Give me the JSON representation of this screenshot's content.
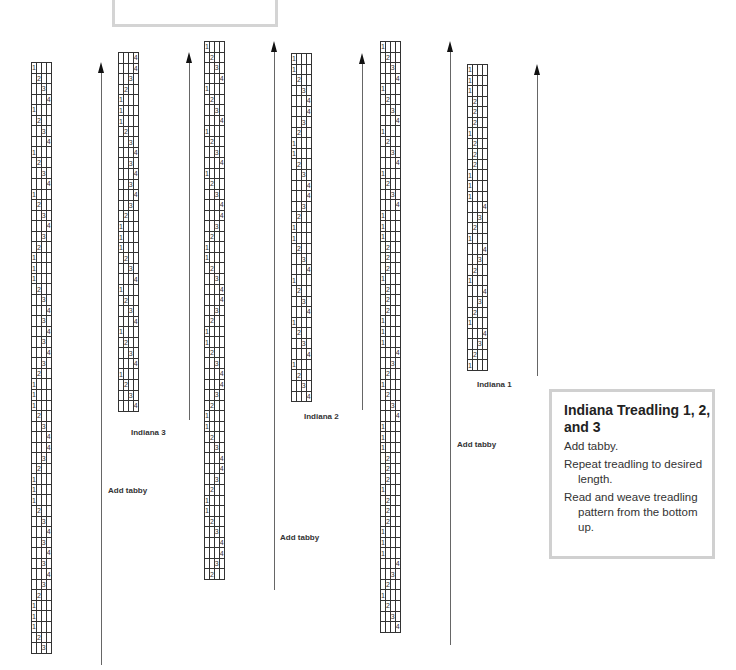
{
  "info": {
    "title": "Indiana Treadling 1, 2, and 3",
    "lines": [
      "Add tabby.",
      "Repeat treadling to desired length.",
      "Read and weave treadling pattern from the bottom up."
    ]
  },
  "drafts": [
    {
      "id": "draft-1",
      "caption": "",
      "tabby_label": "Add tabby",
      "left": 31,
      "top": 62,
      "arrow": {
        "x": 101,
        "top": 62,
        "bottom": 665
      },
      "tabby": {
        "x": 108,
        "y": 486
      },
      "rows": [
        1,
        2,
        3,
        4,
        1,
        2,
        3,
        4,
        1,
        2,
        3,
        4,
        1,
        2,
        3,
        4,
        3,
        2,
        1,
        1,
        1,
        2,
        3,
        4,
        3,
        4,
        3,
        4,
        3,
        2,
        1,
        1,
        1,
        2,
        3,
        4,
        4,
        3,
        2,
        1,
        1,
        1,
        2,
        3,
        4,
        3,
        4,
        3,
        4,
        3,
        2,
        1,
        1,
        1,
        2,
        3
      ]
    },
    {
      "id": "indiana-3",
      "caption": "Indiana 3",
      "tabby_label": "",
      "left": 118,
      "top": 52,
      "arrow": {
        "x": 189,
        "top": 52,
        "bottom": 420
      },
      "caption_pos": {
        "x": 131,
        "y": 428
      },
      "rows": [
        4,
        4,
        3,
        2,
        1,
        1,
        1,
        2,
        3,
        4,
        3,
        4,
        3,
        4,
        3,
        2,
        1,
        1,
        1,
        2,
        3,
        4,
        1,
        2,
        3,
        4,
        1,
        2,
        3,
        4,
        1,
        2,
        3,
        4
      ]
    },
    {
      "id": "draft-3",
      "caption": "",
      "tabby_label": "Add tabby",
      "left": 204,
      "top": 41,
      "arrow": {
        "x": 274,
        "top": 41,
        "bottom": 590
      },
      "tabby": {
        "x": 280,
        "y": 533
      },
      "rows": [
        1,
        2,
        3,
        4,
        1,
        2,
        3,
        4,
        1,
        2,
        3,
        4,
        1,
        2,
        3,
        4,
        4,
        3,
        2,
        1,
        1,
        2,
        3,
        4,
        4,
        3,
        2,
        1,
        1,
        2,
        3,
        4,
        4,
        3,
        2,
        1,
        1,
        2,
        3,
        4,
        4,
        3,
        2,
        1,
        1,
        2,
        3,
        4,
        4,
        3,
        2
      ]
    },
    {
      "id": "indiana-2",
      "caption": "Indiana 2",
      "tabby_label": "",
      "left": 291,
      "top": 53,
      "arrow": {
        "x": 362,
        "top": 53,
        "bottom": 410
      },
      "caption_pos": {
        "x": 304,
        "y": 412
      },
      "rows": [
        1,
        1,
        2,
        3,
        4,
        4,
        3,
        2,
        1,
        1,
        2,
        3,
        4,
        4,
        3,
        2,
        1,
        1,
        2,
        3,
        4,
        1,
        2,
        3,
        4,
        1,
        2,
        3,
        4,
        1,
        2,
        3,
        4
      ]
    },
    {
      "id": "draft-5",
      "caption": "",
      "tabby_label": "Add tabby",
      "left": 380,
      "top": 41,
      "arrow": {
        "x": 450,
        "top": 41,
        "bottom": 645
      },
      "tabby": {
        "x": 457,
        "y": 440
      },
      "rows": [
        1,
        2,
        3,
        4,
        1,
        2,
        3,
        4,
        1,
        2,
        3,
        4,
        1,
        2,
        3,
        4,
        1,
        1,
        1,
        2,
        2,
        2,
        1,
        2,
        2,
        2,
        1,
        1,
        1,
        4,
        3,
        2,
        1,
        2,
        3,
        4,
        1,
        1,
        1,
        2,
        2,
        2,
        1,
        2,
        2,
        2,
        1,
        1,
        1,
        4,
        3,
        2,
        1,
        2,
        3,
        4
      ]
    },
    {
      "id": "indiana-1",
      "caption": "Indiana 1",
      "tabby_label": "",
      "left": 467,
      "top": 64,
      "arrow": {
        "x": 537,
        "top": 64,
        "bottom": 376
      },
      "caption_pos": {
        "x": 477,
        "y": 380
      },
      "rows": [
        1,
        1,
        1,
        2,
        2,
        2,
        1,
        2,
        2,
        2,
        1,
        1,
        1,
        4,
        3,
        2,
        1,
        4,
        3,
        2,
        1,
        4,
        3,
        2,
        1,
        4,
        3,
        2,
        1
      ]
    }
  ]
}
